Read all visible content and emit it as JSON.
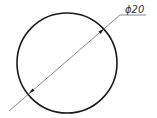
{
  "drawing": {
    "type": "technical-drawing",
    "dimension_label": "ϕ20",
    "feature": "circle",
    "dimension_type": "diameter",
    "colors": {
      "outline": "#1a1a1a",
      "leader": "#555555",
      "background": "#ffffff"
    }
  }
}
